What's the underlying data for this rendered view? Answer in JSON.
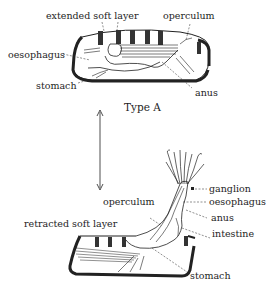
{
  "diagram": {
    "type_a": {
      "caption": "Type A",
      "labels": {
        "extended_soft_layer": "extended soft layer",
        "operculum": "operculum",
        "oesophagus": "oesophagus",
        "stomach": "stomach",
        "anus": "anus"
      }
    },
    "type_b": {
      "labels": {
        "ganglion": "ganglion",
        "oesophagus": "oesophagus",
        "operculum": "operculum",
        "anus": "anus",
        "retracted_soft_layer": "retracted soft layer",
        "intestine": "intestine",
        "stomach": "stomach"
      }
    },
    "arrow": "double-headed vertical arrow"
  }
}
